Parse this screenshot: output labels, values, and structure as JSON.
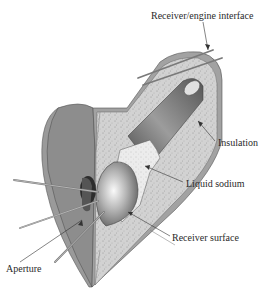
{
  "diagram": {
    "labels": {
      "receiver_engine_interface": "Receiver/engine interface",
      "insulation": "Insulation",
      "liquid_sodium": "Liquid sodium",
      "receiver_surface": "Receiver surface",
      "aperture": "Aperture"
    },
    "colors": {
      "outer_shell": "#8f8f8f",
      "shell_face": "#a8a8a8",
      "insulation": "#cfcfcf",
      "tube": "#6e6e6e",
      "dome_highlight": "#f2f2f2",
      "rays": "#7a7a7a",
      "text": "#2a2a2a"
    }
  }
}
